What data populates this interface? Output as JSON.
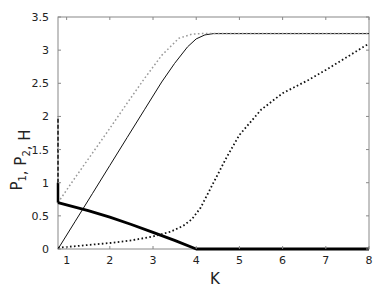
{
  "chart_data": {
    "type": "line",
    "title": "",
    "xlabel": "K",
    "ylabel": "P1, P2, H",
    "ylabel_parts": [
      {
        "text": "P",
        "sub": "1"
      },
      {
        "text": ", P",
        "sub": "2"
      },
      {
        "text": ", H",
        "sub": ""
      }
    ],
    "xlim": [
      0.8,
      8
    ],
    "ylim": [
      0,
      3.5
    ],
    "xticks": [
      1,
      2,
      3,
      4,
      5,
      6,
      7,
      8
    ],
    "xtick_labels": [
      "1",
      "2",
      "3",
      "4",
      "5",
      "6",
      "7",
      "8"
    ],
    "yticks": [
      0,
      0.5,
      1,
      1.5,
      2,
      2.5,
      3,
      3.5
    ],
    "ytick_labels": [
      "0",
      "0.5",
      "1",
      "1.5",
      "2",
      "2.5",
      "3",
      "3.5"
    ],
    "grid": false,
    "legend": null,
    "series": [
      {
        "name": "thin solid",
        "style": "solid",
        "color": "#111111",
        "width": 1,
        "x": [
          0.8,
          1.2,
          1.6,
          2.0,
          2.4,
          2.8,
          3.2,
          3.5,
          3.8,
          4.0,
          4.2,
          4.4,
          5,
          6,
          7,
          8
        ],
        "y": [
          0.0,
          0.42,
          0.84,
          1.26,
          1.68,
          2.1,
          2.52,
          2.8,
          3.05,
          3.17,
          3.23,
          3.25,
          3.25,
          3.25,
          3.25,
          3.25
        ]
      },
      {
        "name": "grey dotted",
        "style": "dotted",
        "color": "#999999",
        "width": 1.5,
        "x": [
          0.8,
          1.2,
          1.6,
          2.0,
          2.4,
          2.8,
          3.2,
          3.6,
          3.9,
          4.1,
          4.4,
          5,
          6,
          7,
          8
        ],
        "y": [
          0.7,
          1.08,
          1.45,
          1.82,
          2.2,
          2.57,
          2.92,
          3.18,
          3.24,
          3.25,
          3.25,
          3.25,
          3.25,
          3.25,
          3.25
        ]
      },
      {
        "name": "thick solid",
        "style": "solid",
        "color": "#000000",
        "width": 2.8,
        "x": [
          0.8,
          1.5,
          2.0,
          2.5,
          3.0,
          3.5,
          4.0,
          5,
          6,
          7,
          8
        ],
        "y": [
          0.7,
          0.58,
          0.48,
          0.37,
          0.25,
          0.13,
          0.0,
          0.0,
          0.0,
          0.0,
          0.0
        ]
      },
      {
        "name": "black dotted",
        "style": "dotted",
        "color": "#111111",
        "width": 1.8,
        "x": [
          0.8,
          1.5,
          2.0,
          2.5,
          3.0,
          3.4,
          3.7,
          3.9,
          4.1,
          4.4,
          4.7,
          5.0,
          5.5,
          6.0,
          6.6,
          7.0,
          7.5,
          8.0
        ],
        "y": [
          0.02,
          0.06,
          0.09,
          0.13,
          0.19,
          0.26,
          0.35,
          0.45,
          0.62,
          1.0,
          1.38,
          1.72,
          2.1,
          2.35,
          2.55,
          2.7,
          2.9,
          3.1
        ]
      },
      {
        "name": "left vertical dashed",
        "style": "dashed",
        "color": "#111111",
        "width": 1.5,
        "x": [
          0.8,
          0.8
        ],
        "y": [
          1.0,
          2.0
        ]
      },
      {
        "name": "left vertical thick",
        "style": "solid",
        "color": "#000000",
        "width": 2.5,
        "x": [
          0.8,
          0.8
        ],
        "y": [
          0.7,
          1.0
        ]
      }
    ]
  },
  "colors": {
    "axis": "#888888",
    "text": "#222222"
  }
}
